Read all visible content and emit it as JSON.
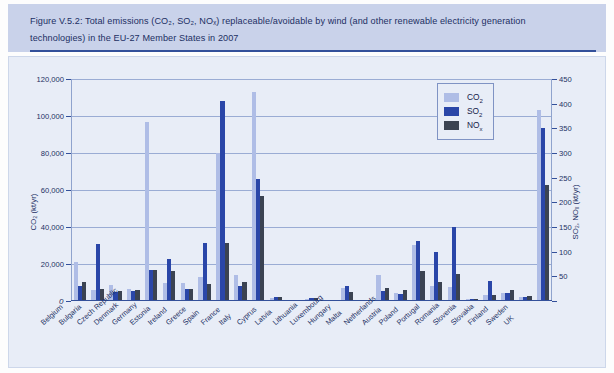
{
  "figure": {
    "caption_line1": "Figure V.5.2: Total emissions (CO₂, SO₂, NOₓ) replaceable/avoidable by wind (and other renewable electricity generation",
    "caption_line2": "technologies) in the EU-27 Member States in 2007"
  },
  "legend": {
    "position": "top-right-inside",
    "items": [
      {
        "name": "CO2",
        "label": "CO₂",
        "color": "#afbde6"
      },
      {
        "name": "SO2",
        "label": "SO₂",
        "color": "#2a46a8"
      },
      {
        "name": "NOx",
        "label": "NOₓ",
        "color": "#3b4352"
      }
    ]
  },
  "axes": {
    "left_title": "CO₂ (kt/yr)",
    "right_title": "SO₂, NOₓ (kt/yr)",
    "left_ticks": [
      "0",
      "20,000",
      "40,000",
      "60,000",
      "80,000",
      "100,000",
      "120,000"
    ],
    "right_ticks": [
      "0",
      "50",
      "100",
      "150",
      "200",
      "250",
      "300",
      "350",
      "400",
      "450"
    ],
    "zero_label": "0"
  },
  "chart_data": {
    "type": "bar",
    "title": "Figure V.5.2: Total emissions (CO₂, SO₂, NOₓ) replaceable/avoidable by wind (and other renewable electricity generation technologies) in the EU-27 Member States in 2007",
    "xlabel": "",
    "ylabel": "CO₂ (kt/yr)",
    "y2label": "SO₂, NOₓ (kt/yr)",
    "ylim": [
      0,
      120000
    ],
    "y2lim": [
      0,
      450
    ],
    "grid": true,
    "legend_position": "upper right",
    "categories": [
      "Belgium",
      "Bulgaria",
      "Czech Republic",
      "Denmark",
      "Germany",
      "Estonia",
      "Ireland",
      "Greece",
      "Spain",
      "France",
      "Italy",
      "Cyprus",
      "Latvia",
      "Lithuania",
      "Luxembourg",
      "Hungary",
      "Malta",
      "Netherlands",
      "Austria",
      "Poland",
      "Portugal",
      "Romania",
      "Slovenia",
      "Slovakia",
      "Finland",
      "Sweden",
      "UK"
    ],
    "series": [
      {
        "name": "CO₂",
        "axis": "left",
        "unit": "kt/yr",
        "color": "#afbde6",
        "values": [
          21000,
          6000,
          8500,
          6500,
          97000,
          9500,
          9500,
          13000,
          80000,
          14000,
          113000,
          1800,
          600,
          1200,
          600,
          7000,
          500,
          14000,
          4500,
          30500,
          8000,
          7500,
          1200,
          3500,
          4500,
          2000,
          103000
        ]
      },
      {
        "name": "SO₂",
        "axis": "right",
        "unit": "kt/yr",
        "color": "#2a46a8",
        "values": [
          30,
          115,
          18,
          20,
          63,
          85,
          25,
          118,
          405,
          30,
          247,
          9,
          2,
          6,
          2,
          30,
          2,
          20,
          15,
          122,
          100,
          150,
          5,
          40,
          16,
          8,
          350
        ]
      },
      {
        "name": "NOₓ",
        "axis": "right",
        "unit": "kt/yr",
        "color": "#3b4352",
        "values": [
          38,
          25,
          20,
          22,
          63,
          60,
          25,
          35,
          118,
          38,
          212,
          8,
          3,
          7,
          2,
          18,
          2,
          27,
          22,
          60,
          38,
          55,
          5,
          12,
          22,
          10,
          235
        ]
      }
    ]
  }
}
